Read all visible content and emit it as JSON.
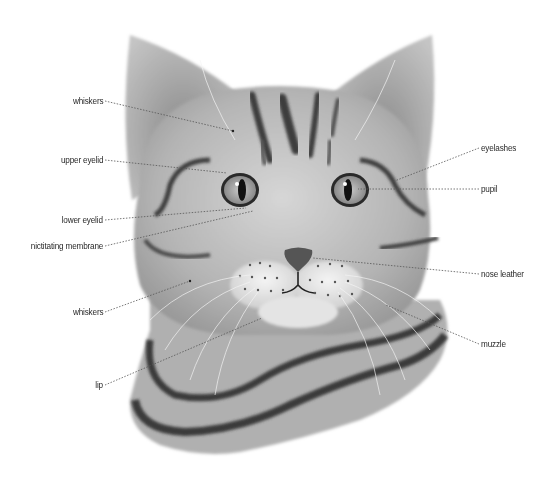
{
  "diagram": {
    "colors": {
      "fur_light": "#d2d2d2",
      "fur_mid": "#a9a9a9",
      "stripe": "#3c3c3c",
      "muzzle": "#ececec",
      "leader_line": "#555555",
      "label_text": "#2a2a2a"
    },
    "labels_left": [
      {
        "id": "whiskers-upper",
        "text": "whiskers",
        "x": 103,
        "y": 101,
        "target": [
          233,
          131
        ]
      },
      {
        "id": "upper-eyelid",
        "text": "upper eyelid",
        "x": 103,
        "y": 160,
        "target": [
          227,
          173
        ]
      },
      {
        "id": "lower-eyelid",
        "text": "lower eyelid",
        "x": 103,
        "y": 220,
        "target": [
          246,
          208
        ]
      },
      {
        "id": "nictitating-membrane",
        "text": "nictitating membrane",
        "x": 103,
        "y": 246,
        "target": [
          253,
          211
        ]
      },
      {
        "id": "whiskers-lower",
        "text": "whiskers",
        "x": 103,
        "y": 312,
        "target": [
          190,
          281
        ]
      },
      {
        "id": "lip",
        "text": "lip",
        "x": 103,
        "y": 385,
        "target": [
          262,
          318
        ]
      }
    ],
    "labels_right": [
      {
        "id": "eyelashes",
        "text": "eyelashes",
        "x": 481,
        "y": 148,
        "target": [
          392,
          182
        ]
      },
      {
        "id": "pupil",
        "text": "pupil",
        "x": 481,
        "y": 189,
        "target": [
          358,
          189
        ]
      },
      {
        "id": "nose-leather",
        "text": "nose leather",
        "x": 481,
        "y": 274,
        "target": [
          313,
          258
        ]
      },
      {
        "id": "muzzle",
        "text": "muzzle",
        "x": 481,
        "y": 344,
        "target": [
          386,
          305
        ]
      }
    ]
  }
}
